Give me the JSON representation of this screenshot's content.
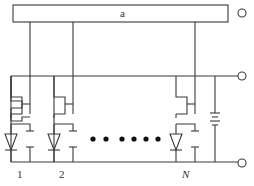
{
  "diagram": {
    "block_label": "a",
    "cell_labels": [
      "1",
      "2",
      "N"
    ],
    "ellipsis_dots": 6,
    "colors": {
      "line": "#3a3a3a",
      "background": "#ffffff"
    }
  }
}
